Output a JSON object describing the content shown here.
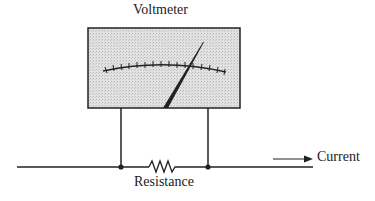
{
  "diagram": {
    "title": "Voltmeter",
    "labels": {
      "resistance": "Resistance",
      "current": "Current"
    },
    "components": [
      {
        "type": "voltmeter",
        "label": "Voltmeter",
        "scale_ticks": 15
      },
      {
        "type": "resistor",
        "label": "Resistance"
      },
      {
        "type": "current-arrow",
        "label": "Current",
        "direction": "right"
      }
    ],
    "colors": {
      "line": "#222222",
      "meter_face": "#d9d9d9"
    }
  }
}
